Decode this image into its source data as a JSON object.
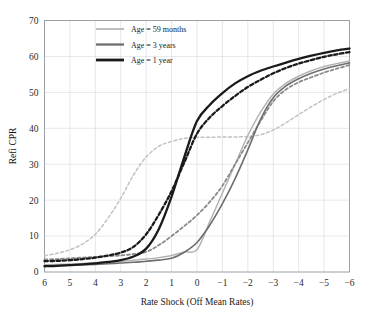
{
  "chart_data": {
    "type": "line",
    "title": "",
    "xlabel": "Rate Shock (Off Mean Rates)",
    "ylabel": "Refi CPR",
    "xlim": [
      6,
      -6
    ],
    "ylim": [
      0,
      70
    ],
    "x_ticks": [
      "6",
      "5",
      "4",
      "3",
      "2",
      "1",
      "0",
      "-1",
      "-2",
      "-3",
      "-4",
      "-5",
      "-6"
    ],
    "y_ticks": [
      "0",
      "10",
      "20",
      "30",
      "40",
      "50",
      "60",
      "70"
    ],
    "x_axis_reversed": true,
    "grid": true,
    "legend_position": "top-left",
    "legend": [
      {
        "label": "Age = 59 months",
        "color": "#b3b3b3"
      },
      {
        "label": "Age = 3 years",
        "color": "#6e6e6e"
      },
      {
        "label": "Age = 1 year",
        "color": "#1a1a1a"
      }
    ],
    "x": [
      6,
      5.5,
      5,
      4.5,
      4,
      3.5,
      3,
      2.5,
      2,
      1.5,
      1,
      0.5,
      0,
      -0.5,
      -1,
      -1.5,
      -2,
      -2.5,
      -3,
      -3.5,
      -4,
      -4.5,
      -5,
      -5.5,
      -6
    ],
    "series": [
      {
        "name": "Age = 59 months (dashed)",
        "color": "#c2c2c2",
        "dash": "3,2.5",
        "width": 1.5,
        "values": [
          4.5,
          5.2,
          6.2,
          7.8,
          10.5,
          15.0,
          20.5,
          27.0,
          32.0,
          35.0,
          36.3,
          37.2,
          37.5,
          37.5,
          37.6,
          37.6,
          37.7,
          38.2,
          39.5,
          41.5,
          43.8,
          46.0,
          48.0,
          49.7,
          51.0
        ]
      },
      {
        "name": "Age = 59 months (solid)",
        "color": "#b3b3b3",
        "dash": "none",
        "width": 1.5,
        "values": [
          2.0,
          2.1,
          2.2,
          2.4,
          2.6,
          2.8,
          3.0,
          3.3,
          3.6,
          4.0,
          4.6,
          5.6,
          6.2,
          14.0,
          22.0,
          30.0,
          38.0,
          44.5,
          49.5,
          52.5,
          54.5,
          56.0,
          57.2,
          58.0,
          58.7
        ]
      },
      {
        "name": "Age = 3 years (dashed)",
        "color": "#8a8a8a",
        "dash": "3,2.5",
        "width": 1.8,
        "values": [
          3.5,
          3.6,
          3.8,
          4.0,
          4.2,
          4.4,
          4.6,
          5.0,
          5.6,
          7.5,
          10.0,
          12.8,
          15.8,
          19.5,
          24.0,
          30.0,
          36.0,
          42.0,
          47.5,
          50.8,
          52.8,
          54.2,
          55.5,
          56.6,
          57.6
        ]
      },
      {
        "name": "Age = 3 years (solid)",
        "color": "#6e6e6e",
        "dash": "none",
        "width": 1.6,
        "values": [
          1.7,
          1.8,
          1.9,
          2.0,
          2.1,
          2.3,
          2.5,
          2.7,
          3.0,
          3.3,
          3.8,
          5.5,
          8.2,
          13.0,
          19.0,
          26.0,
          34.0,
          42.5,
          48.5,
          51.8,
          53.8,
          55.3,
          56.5,
          57.4,
          58.2
        ]
      },
      {
        "name": "Age = 1 year (dashed)",
        "color": "#1a1a1a",
        "dash": "3.5,2.5",
        "width": 2.3,
        "values": [
          3.0,
          3.1,
          3.3,
          3.6,
          4.0,
          4.6,
          5.4,
          7.0,
          10.5,
          16.0,
          22.5,
          30.5,
          38.5,
          43.0,
          46.2,
          49.0,
          51.5,
          53.5,
          55.3,
          56.8,
          58.0,
          59.0,
          59.9,
          60.6,
          61.2
        ]
      },
      {
        "name": "Age = 1 year (solid)",
        "color": "#1a1a1a",
        "dash": "none",
        "width": 2.3,
        "values": [
          1.6,
          1.7,
          1.9,
          2.1,
          2.4,
          2.8,
          3.3,
          4.3,
          6.5,
          12.0,
          21.0,
          32.0,
          42.0,
          46.5,
          49.8,
          52.5,
          54.5,
          56.0,
          57.2,
          58.3,
          59.3,
          60.2,
          61.0,
          61.7,
          62.2
        ]
      }
    ]
  }
}
